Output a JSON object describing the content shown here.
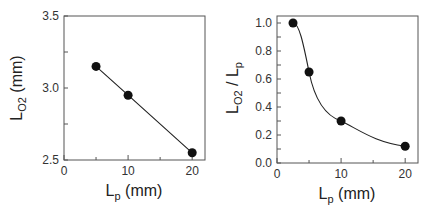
{
  "chart_data": [
    {
      "type": "line",
      "title": "",
      "xlabel": "L_p (mm)",
      "ylabel": "L_O2 (mm)",
      "xlim": [
        0,
        22
      ],
      "ylim": [
        2.5,
        3.5
      ],
      "xticks": [
        "0",
        "10",
        "20"
      ],
      "yticks": [
        "2.5",
        "3.0",
        "3.5"
      ],
      "grid": false,
      "legend": null,
      "series": [
        {
          "name": "L_O2",
          "x": [
            5,
            10,
            20
          ],
          "values": [
            3.15,
            2.95,
            2.55
          ],
          "marker": "filled-circle",
          "line": "linear"
        }
      ]
    },
    {
      "type": "line",
      "title": "",
      "xlabel": "L_p (mm)",
      "ylabel": "L_O2 / L_p",
      "xlim": [
        0,
        22
      ],
      "ylim": [
        0.0,
        1.05
      ],
      "xticks": [
        "0",
        "10",
        "20"
      ],
      "yticks": [
        "0.0",
        "0.2",
        "0.4",
        "0.6",
        "0.8",
        "1.0"
      ],
      "grid": false,
      "legend": null,
      "series": [
        {
          "name": "L_O2/L_p",
          "x": [
            2.5,
            5,
            10,
            20
          ],
          "values": [
            1.0,
            0.65,
            0.3,
            0.12
          ],
          "marker": "filled-circle",
          "line": "smooth"
        }
      ]
    }
  ],
  "labels": {
    "left": {
      "y_main": "L",
      "y_sub": "O2",
      "y_unit": " (mm)",
      "x_main": "L",
      "x_sub": "p",
      "x_unit": " (mm)"
    },
    "right": {
      "y_main1": "L",
      "y_sub1": "O2",
      "y_slash": " / ",
      "y_main2": "L",
      "y_sub2": "p",
      "x_main": "L",
      "x_sub": "p",
      "x_unit": " (mm)"
    }
  }
}
